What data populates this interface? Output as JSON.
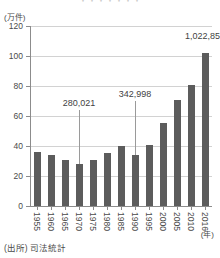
{
  "figure": {
    "faint_title": "・・・・・・・",
    "y_unit_label": "(万件)",
    "x_unit_label": "(年)",
    "source_note": "(出所) 司法統計",
    "bar_color": "#5c5c5c",
    "grid_color": "#d2d2d2",
    "axis_color": "#8c8c8c"
  },
  "chart_data": {
    "type": "bar",
    "title": "",
    "xlabel": "(年)",
    "ylabel": "(万件)",
    "ylim": [
      0,
      120
    ],
    "yticks": [
      0,
      20,
      40,
      60,
      80,
      100,
      120
    ],
    "grid": true,
    "legend": "none",
    "unit_note": "万件 = 10,000 cases",
    "categories": [
      "1955",
      "1960",
      "1965",
      "1970",
      "1975",
      "1980",
      "1985",
      "1990",
      "1995",
      "2000",
      "2005",
      "2010",
      "2016"
    ],
    "values": [
      36.0,
      34.0,
      31.0,
      28.0,
      30.5,
      35.5,
      40.0,
      34.3,
      41.0,
      55.5,
      71.0,
      81.0,
      102.3
    ],
    "annotations": [
      {
        "category": "1970",
        "text": "280,021",
        "value": 28.0
      },
      {
        "category": "1990",
        "text": "342,998",
        "value": 34.3
      },
      {
        "category": "2016",
        "text": "1,022,859",
        "value": 102.3
      }
    ]
  }
}
